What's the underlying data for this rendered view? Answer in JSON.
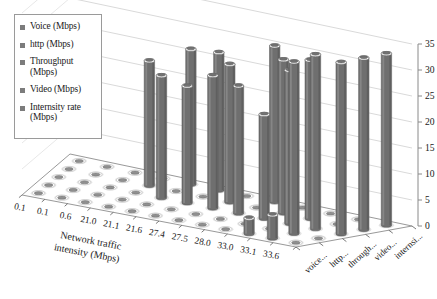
{
  "legend": {
    "items": [
      {
        "label": "Voice (Mbps)",
        "color": "#7c7c7c"
      },
      {
        "label": "http (Mbps)",
        "color": "#7c7c7c"
      },
      {
        "label": "Throughput (Mbps)",
        "color": "#7c7c7c"
      },
      {
        "label": "Video (Mbps)",
        "color": "#7c7c7c"
      },
      {
        "label": "Internsity rate (Mbps)",
        "color": "#7c7c7c"
      }
    ]
  },
  "chart_data": {
    "type": "bar",
    "title": "",
    "xlabel": "Network traffic intensity (Mbps)",
    "ylabel": "",
    "zlabel": "",
    "projection": "3d-cylinder",
    "grid": true,
    "legend_position": "top-left",
    "zlim": [
      0,
      35
    ],
    "ztick_labels": [
      "0",
      "5",
      "10",
      "15",
      "20",
      "25",
      "30",
      "35"
    ],
    "ztick_values": [
      0,
      5,
      10,
      15,
      20,
      25,
      30,
      35
    ],
    "categories": [
      "0.1",
      "0.1",
      "0.6",
      "21.0",
      "21.1",
      "21.6",
      "27.4",
      "27.5",
      "28.0",
      "33.0",
      "33.1",
      "33.6"
    ],
    "depth_labels": [
      "voice...",
      "http...",
      "through...",
      "video...",
      "internsi..."
    ],
    "series": [
      {
        "name": "voice...",
        "values": [
          0,
          0,
          0,
          0,
          0,
          0,
          0,
          0,
          0,
          3.0,
          4.5,
          0
        ]
      },
      {
        "name": "http...",
        "values": [
          0,
          0,
          0,
          0,
          0,
          0,
          0,
          0,
          0,
          0,
          33.0,
          0
        ]
      },
      {
        "name": "through...",
        "values": [
          0,
          0,
          0,
          0,
          23.5,
          22.5,
          25.5,
          24.5,
          20.0,
          29.5,
          33.5,
          33.0
        ]
      },
      {
        "name": "video...",
        "values": [
          0,
          0,
          0,
          24.0,
          0,
          0,
          26.5,
          0,
          29.5,
          30.5,
          0,
          33.0
        ]
      },
      {
        "name": "internsi...",
        "values": [
          0,
          0,
          0,
          0,
          26.0,
          26.5,
          0,
          30.0,
          0,
          0,
          0,
          33.0
        ]
      }
    ]
  }
}
